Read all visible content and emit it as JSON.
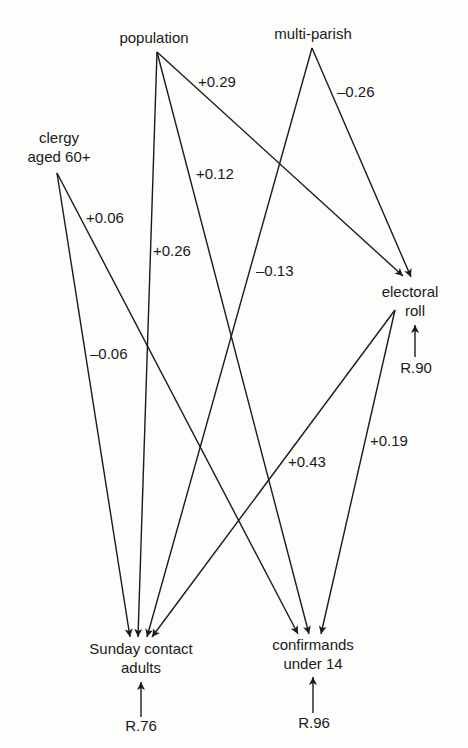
{
  "diagram": {
    "type": "path-diagram",
    "nodes": {
      "population": {
        "line1": "population"
      },
      "multi_parish": {
        "line1": "multi-parish"
      },
      "clergy": {
        "line1": "clergy",
        "line2": "aged 60+"
      },
      "electoral_roll": {
        "line1": "electoral",
        "line2": "roll"
      },
      "sunday_contact": {
        "line1": "Sunday contact",
        "line2": "adults"
      },
      "confirmands": {
        "line1": "confirmands",
        "line2": "under 14"
      }
    },
    "edges": [
      {
        "from": "population",
        "to": "electoral_roll",
        "coef": "+0.29"
      },
      {
        "from": "population",
        "to": "confirmands",
        "coef": "+0.12"
      },
      {
        "from": "population",
        "to": "sunday_contact",
        "coef": "+0.26"
      },
      {
        "from": "multi_parish",
        "to": "electoral_roll",
        "coef": "–0.26"
      },
      {
        "from": "multi_parish",
        "to": "sunday_contact",
        "coef": "–0.13"
      },
      {
        "from": "clergy",
        "to": "confirmands",
        "coef": "+0.06"
      },
      {
        "from": "clergy",
        "to": "sunday_contact",
        "coef": "–0.06"
      },
      {
        "from": "electoral_roll",
        "to": "sunday_contact",
        "coef": "+0.43"
      },
      {
        "from": "electoral_roll",
        "to": "confirmands",
        "coef": "+0.19"
      }
    ],
    "residuals": {
      "electoral_roll": "R.90",
      "sunday_contact": "R.76",
      "confirmands": "R.96"
    },
    "colors": {
      "ink": "#1a1a1a",
      "background": "#fdfdfc"
    }
  }
}
